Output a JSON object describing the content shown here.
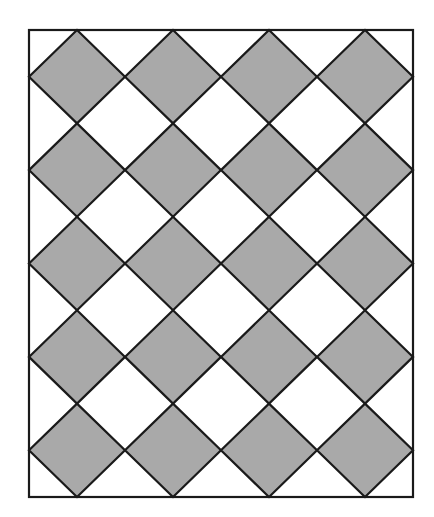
{
  "diagram": {
    "type": "diamond-tiling",
    "frame": {
      "x": 29,
      "y": 30,
      "width": 384,
      "height": 467
    },
    "columns": 4,
    "rows": 5,
    "colors": {
      "background": "#ffffff",
      "diamond_fill": "#a9a9a9",
      "stroke": "#1a1a1a"
    },
    "stroke_width": 2.2
  }
}
